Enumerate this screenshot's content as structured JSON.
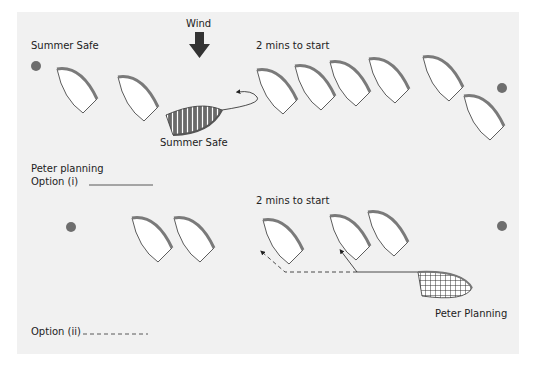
{
  "top_scenario": {
    "title": "Summer Safe",
    "wind_label": "Wind",
    "timing_label": "2 mins to start",
    "highlighted_boat_label": "Summer Safe",
    "highlighted_boat_pattern": "striped"
  },
  "bottom_scenario": {
    "title": "Peter planning",
    "option_i_label": "Option (i)",
    "option_ii_label": "Option (ii)",
    "timing_label": "2 mins to start",
    "highlighted_boat_label": "Peter Planning",
    "highlighted_boat_pattern": "checkered"
  },
  "legend": {
    "option_i_line": "solid",
    "option_ii_line": "dashed"
  },
  "colors": {
    "background": "#f1f1f1",
    "mark": "#6e6e6e",
    "boat_fill": "#ffffff",
    "boat_outline": "#333333",
    "deck_edge": "#7a7a7a",
    "wind_arrow": "#333333"
  }
}
